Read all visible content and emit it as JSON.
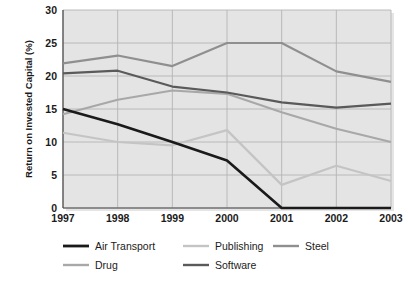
{
  "chart_data": {
    "type": "line",
    "title": "",
    "xlabel": "",
    "ylabel": "Return on Invested Capital (%)",
    "categories": [
      "1997",
      "1998",
      "1999",
      "2000",
      "2001",
      "2002",
      "2003"
    ],
    "x": [
      1997,
      1998,
      1999,
      2000,
      2001,
      2002,
      2003
    ],
    "xlim": [
      1997,
      2003
    ],
    "ylim": [
      0,
      30
    ],
    "yticks": [
      0,
      5,
      10,
      15,
      20,
      25,
      30
    ],
    "ytick_labels": [
      "0",
      "5",
      "10",
      "15",
      "20",
      "25",
      "30"
    ],
    "grid": true,
    "legend_position": "bottom",
    "series": [
      {
        "name": "Air Transport",
        "color": "#1a1a1a",
        "values": [
          15.0,
          12.7,
          10.0,
          7.2,
          0.0,
          0.0,
          0.0
        ]
      },
      {
        "name": "Drug",
        "color": "#a8a8a8",
        "values": [
          14.2,
          16.4,
          17.8,
          17.3,
          14.5,
          12.0,
          10.0
        ]
      },
      {
        "name": "Publishing",
        "color": "#c4c4c4",
        "values": [
          11.4,
          10.0,
          9.5,
          11.8,
          3.5,
          6.4,
          4.1
        ]
      },
      {
        "name": "Steel",
        "color": "#8f8f8f",
        "values": [
          21.9,
          23.1,
          21.5,
          25.0,
          25.0,
          20.7,
          19.1
        ]
      },
      {
        "name": "Software",
        "color": "#5a5a5a",
        "values": [
          20.4,
          20.8,
          18.4,
          17.5,
          16.0,
          15.2,
          15.8
        ]
      }
    ]
  },
  "legend": {
    "entries": [
      {
        "label": "Air Transport",
        "color": "#1a1a1a"
      },
      {
        "label": "Publishing",
        "color": "#c4c4c4"
      },
      {
        "label": "Steel",
        "color": "#8f8f8f"
      },
      {
        "label": "Drug",
        "color": "#a8a8a8"
      },
      {
        "label": "Software",
        "color": "#5a5a5a"
      }
    ]
  },
  "style": {
    "plot_background": "#e4e4e4",
    "grid_color": "#b4b4b4",
    "axis_color": "#4a4a4a",
    "page_background": "#ffffff",
    "text_color": "#1b1b1b"
  }
}
